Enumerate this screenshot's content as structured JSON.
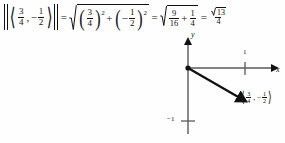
{
  "figure": {
    "kind": "vector-magnitude-figure",
    "background_color": "#fefefe",
    "ink_color": "#111111"
  },
  "equation": {
    "full_text": "|⟨3/4, −1/2⟩| = √((3/4)² + (−1/2)²) = √(9/16 + 1/4) = √13/4",
    "lhs": {
      "vector": {
        "open_bracket": "⟨",
        "close_bracket": "⟩",
        "comma": ",",
        "x_sign": "",
        "x_num": "3",
        "x_den": "4",
        "y_sign": "−",
        "y_num": "1",
        "y_den": "2"
      }
    },
    "equals_1": "=",
    "term_1": {
      "open_paren": "(",
      "close_paren": ")",
      "first": {
        "num": "3",
        "den": "4",
        "exponent": "2"
      },
      "plus": "+",
      "second": {
        "sign": "−",
        "num": "1",
        "den": "2",
        "exponent": "2"
      }
    },
    "equals_2": "=",
    "term_2": {
      "first": {
        "num": "9",
        "den": "16"
      },
      "plus": "+",
      "second": {
        "num": "1",
        "den": "4"
      }
    },
    "equals_3": "=",
    "result": {
      "radicand": "13",
      "numerator_radical": "√",
      "denominator": "4"
    }
  },
  "diagram": {
    "y_axis_label": "y",
    "x_axis_label": "x",
    "x_tick_label": "1",
    "y_tick_label": "−1",
    "origin_dot": true,
    "vector": {
      "from": "origin",
      "to_x": "3/4",
      "to_y": "−1/2",
      "label": {
        "open_bracket": "⟨",
        "close_bracket": "⟩",
        "comma": ",",
        "x_num": "3",
        "x_den": "4",
        "y_sign": "−",
        "y_num": "1",
        "y_den": "2"
      }
    }
  }
}
